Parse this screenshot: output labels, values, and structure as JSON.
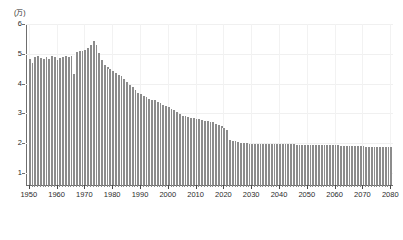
{
  "axis": {
    "unit_label": "(万)",
    "y_ticks": [
      1,
      2,
      3,
      4,
      5,
      6
    ],
    "y_min": 0.6,
    "y_max": 6,
    "x_ticks": [
      1950,
      1960,
      1970,
      1980,
      1990,
      2000,
      2010,
      2020,
      2030,
      2040,
      2050,
      2060,
      2070,
      2080
    ],
    "x_min": 1949,
    "x_max": 2081
  },
  "style": {
    "bar_color": "#8c8c8c",
    "axis_color": "#6e6e6e",
    "grid_color": "#f0f0f0",
    "text_color": "#2b2b2b",
    "background": "#ffffff"
  },
  "chart_data": {
    "type": "bar",
    "title": "",
    "subtitle": "",
    "xlabel": "",
    "ylabel": "(万)",
    "ylim": [
      0.6,
      6
    ],
    "xlim": [
      1949,
      2081
    ],
    "grid": true,
    "legend": "none",
    "series": [
      {
        "name": "出生数",
        "x": [
          1950,
          1951,
          1952,
          1953,
          1954,
          1955,
          1956,
          1957,
          1958,
          1959,
          1960,
          1961,
          1962,
          1963,
          1964,
          1965,
          1966,
          1967,
          1968,
          1969,
          1970,
          1971,
          1972,
          1973,
          1974,
          1975,
          1976,
          1977,
          1978,
          1979,
          1980,
          1981,
          1982,
          1983,
          1984,
          1985,
          1986,
          1987,
          1988,
          1989,
          1990,
          1991,
          1992,
          1993,
          1994,
          1995,
          1996,
          1997,
          1998,
          1999,
          2000,
          2001,
          2002,
          2003,
          2004,
          2005,
          2006,
          2007,
          2008,
          2009,
          2010,
          2011,
          2012,
          2013,
          2014,
          2015,
          2016,
          2017,
          2018,
          2019,
          2020,
          2021,
          2022,
          2023,
          2024,
          2025,
          2026,
          2027,
          2028,
          2029,
          2030,
          2031,
          2032,
          2033,
          2034,
          2035,
          2036,
          2037,
          2038,
          2039,
          2040,
          2041,
          2042,
          2043,
          2044,
          2045,
          2046,
          2047,
          2048,
          2049,
          2050,
          2051,
          2052,
          2053,
          2054,
          2055,
          2056,
          2057,
          2058,
          2059,
          2060,
          2061,
          2062,
          2063,
          2064,
          2065,
          2066,
          2067,
          2068,
          2069,
          2070,
          2071,
          2072,
          2073,
          2074,
          2075,
          2076,
          2077,
          2078,
          2079,
          2080
        ],
        "values": [
          4.84,
          4.7,
          4.88,
          4.92,
          4.86,
          4.82,
          4.88,
          4.84,
          4.92,
          4.88,
          4.8,
          4.86,
          4.9,
          4.94,
          4.88,
          4.92,
          4.34,
          5.06,
          5.1,
          5.08,
          5.12,
          5.2,
          5.3,
          5.42,
          5.3,
          5.02,
          4.8,
          4.64,
          4.56,
          4.5,
          4.44,
          4.36,
          4.3,
          4.24,
          4.16,
          4.06,
          3.96,
          3.88,
          3.8,
          3.7,
          3.64,
          3.6,
          3.56,
          3.5,
          3.46,
          3.44,
          3.4,
          3.36,
          3.3,
          3.24,
          3.2,
          3.16,
          3.1,
          3.04,
          2.98,
          2.92,
          2.9,
          2.88,
          2.86,
          2.84,
          2.82,
          2.8,
          2.78,
          2.76,
          2.74,
          2.72,
          2.7,
          2.66,
          2.62,
          2.58,
          2.52,
          2.46,
          2.1,
          2.08,
          2.06,
          2.04,
          2.02,
          2.01,
          2.0,
          1.99,
          1.98,
          1.98,
          1.97,
          1.97,
          1.96,
          1.96,
          1.96,
          1.96,
          1.96,
          1.96,
          1.96,
          1.96,
          1.96,
          1.96,
          1.96,
          1.96,
          1.95,
          1.95,
          1.95,
          1.95,
          1.95,
          1.95,
          1.95,
          1.94,
          1.94,
          1.94,
          1.94,
          1.94,
          1.93,
          1.93,
          1.93,
          1.93,
          1.92,
          1.92,
          1.92,
          1.91,
          1.91,
          1.91,
          1.9,
          1.9,
          1.9,
          1.89,
          1.89,
          1.89,
          1.88,
          1.88,
          1.88,
          1.87,
          1.87,
          1.86,
          1.86
        ]
      }
    ]
  }
}
